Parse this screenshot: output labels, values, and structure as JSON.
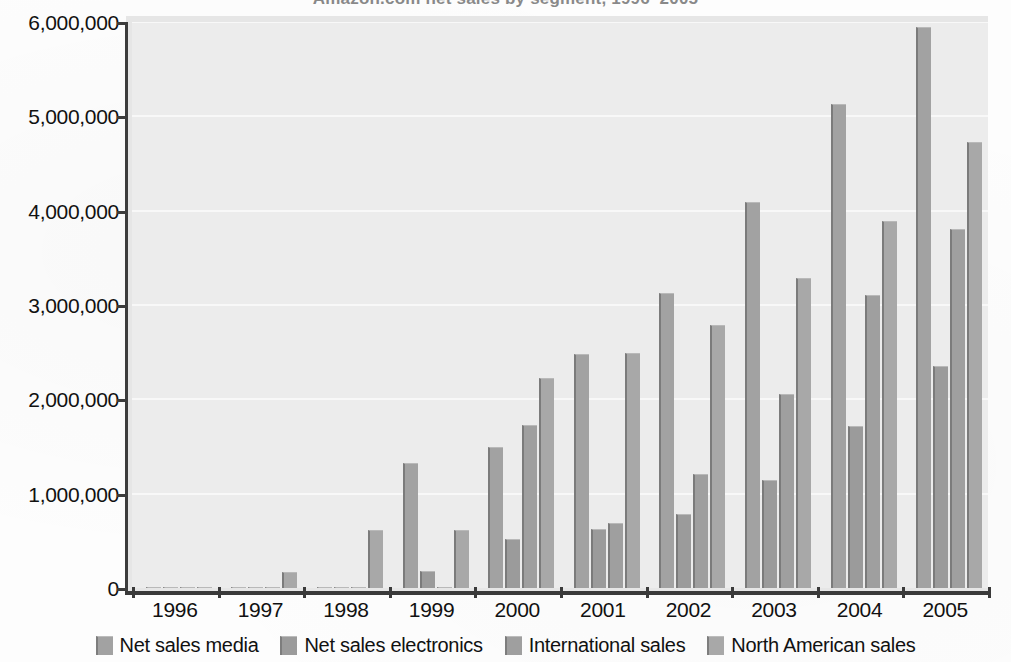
{
  "chart_data": {
    "type": "bar",
    "title": "Amazon.com net sales by segment, 1996–2005",
    "xlabel": "",
    "ylabel": "",
    "ylim": [
      0,
      6000000
    ],
    "ytick_values": [
      0,
      1000000,
      2000000,
      3000000,
      4000000,
      5000000,
      6000000
    ],
    "ytick_labels": [
      "0",
      "1,000,000",
      "2,000,000",
      "3,000,000",
      "4,000,000",
      "5,000,000",
      "6,000,000"
    ],
    "categories": [
      "1996",
      "1997",
      "1998",
      "1999",
      "2000",
      "2001",
      "2002",
      "2003",
      "2004",
      "2005"
    ],
    "grid": true,
    "legend_position": "bottom",
    "series": [
      {
        "name": "Net sales media",
        "color": "#a2a2a2",
        "values": [
          0,
          0,
          0,
          1330000,
          1500000,
          2480000,
          3130000,
          4090000,
          5130000,
          5950000
        ]
      },
      {
        "name": "Net sales electronics",
        "color": "#9b9b9b",
        "values": [
          0,
          0,
          0,
          180000,
          520000,
          630000,
          780000,
          1150000,
          1720000,
          2350000
        ]
      },
      {
        "name": "International sales",
        "color": "#9f9f9f",
        "values": [
          0,
          0,
          0,
          0,
          1730000,
          690000,
          1210000,
          2060000,
          3110000,
          3810000
        ]
      },
      {
        "name": "North American sales",
        "color": "#a8a8a8",
        "values": [
          15000,
          170000,
          620000,
          620000,
          2230000,
          2490000,
          2790000,
          3290000,
          3890000,
          4730000
        ]
      }
    ]
  },
  "legend": {
    "items": [
      {
        "label": "Net sales media"
      },
      {
        "label": "Net sales electronics"
      },
      {
        "label": "International sales"
      },
      {
        "label": "North American sales"
      }
    ]
  },
  "axes": {
    "y": {
      "labels": [
        "6,000,000",
        "5,000,000",
        "4,000,000",
        "3,000,000",
        "2,000,000",
        "1,000,000",
        "0"
      ]
    },
    "x": {
      "labels": [
        "1996",
        "1997",
        "1998",
        "1999",
        "2000",
        "2001",
        "2002",
        "2003",
        "2004",
        "2005"
      ]
    }
  }
}
